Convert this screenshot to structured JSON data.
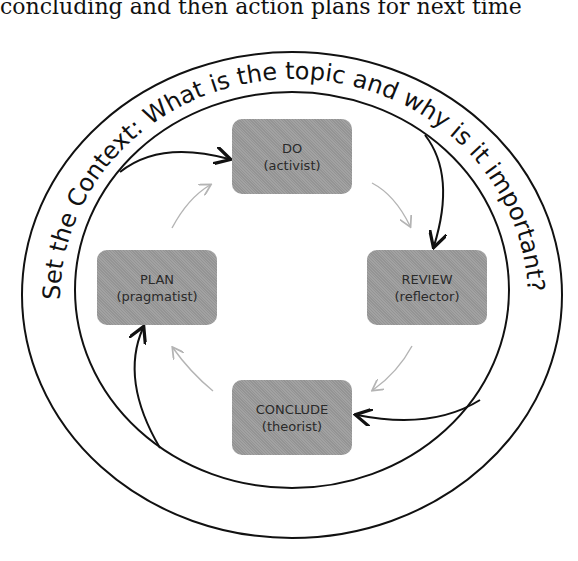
{
  "caption": "concluding and then action plans for next time",
  "ring": {
    "text": "Set the Context: What is the topic and why is it important?"
  },
  "stages": [
    {
      "id": "do",
      "title": "DO",
      "role": "(activist)"
    },
    {
      "id": "review",
      "title": "REVIEW",
      "role": "(reflector)"
    },
    {
      "id": "conclude",
      "title": "CONCLUDE",
      "role": "(theorist)"
    },
    {
      "id": "plan",
      "title": "PLAN",
      "role": "(pragmatist)"
    }
  ],
  "colors": {
    "box_fill": "#9c9c9c",
    "outline": "#111111",
    "inner_arrow": "#b4b4b4"
  }
}
